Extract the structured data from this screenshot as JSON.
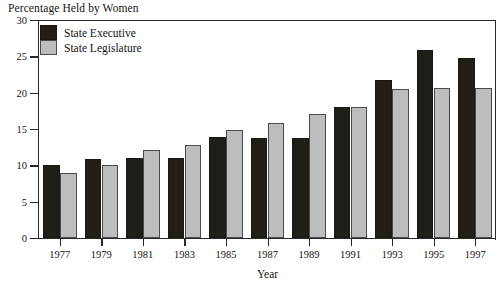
{
  "chart_data": {
    "type": "bar",
    "title": "Percentage Held by Women",
    "xlabel": "Year",
    "ylabel": "",
    "ylim": [
      0,
      30
    ],
    "yticks": [
      0,
      5,
      10,
      15,
      20,
      25,
      30
    ],
    "grid": false,
    "legend_position": "top-left",
    "categories": [
      "1977",
      "1979",
      "1981",
      "1983",
      "1985",
      "1987",
      "1989",
      "1991",
      "1993",
      "1995",
      "1997"
    ],
    "series": [
      {
        "name": "State Executive",
        "color": "#211d18",
        "values": [
          10.0,
          10.9,
          11.0,
          11.0,
          13.9,
          13.8,
          13.8,
          18.0,
          21.7,
          25.9,
          24.8
        ]
      },
      {
        "name": "State Legislature",
        "color": "#bdbdbd",
        "values": [
          9.0,
          10.0,
          12.1,
          12.8,
          14.8,
          15.8,
          17.0,
          18.0,
          20.5,
          20.6,
          20.6
        ]
      }
    ]
  }
}
